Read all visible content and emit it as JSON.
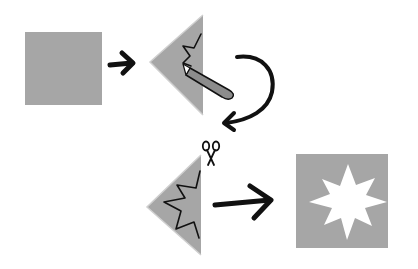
{
  "diagram": {
    "colors": {
      "paper": "#a6a6a6",
      "ink": "#111111",
      "background": "#ffffff",
      "cutout": "#ffffff"
    },
    "steps": [
      {
        "id": 1,
        "shape": "square",
        "description": "Square sheet of paper"
      },
      {
        "id": 2,
        "shape": "folded-triangle",
        "description": "Fold into triangle, draw zigzag with pencil",
        "icon": "pencil-icon"
      },
      {
        "id": 3,
        "shape": "folded-triangle",
        "description": "Cut along zigzag with scissors",
        "icon": "scissors-icon"
      },
      {
        "id": 4,
        "shape": "square-with-star",
        "description": "Unfold to reveal star cut-out"
      }
    ],
    "arrows": [
      {
        "from": 1,
        "to": 2,
        "style": "straight"
      },
      {
        "from": 2,
        "to": 3,
        "style": "curved"
      },
      {
        "from": 3,
        "to": 4,
        "style": "straight"
      }
    ]
  }
}
